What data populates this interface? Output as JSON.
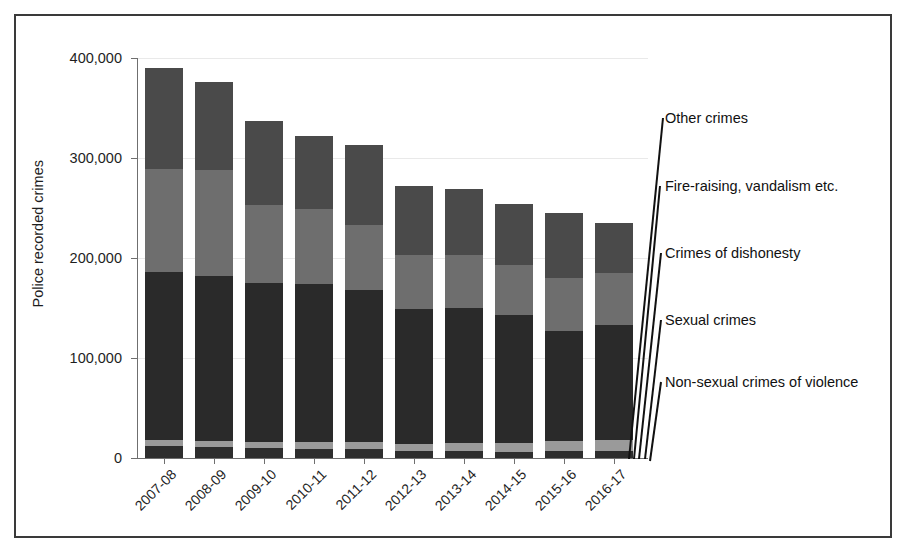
{
  "chart_data": {
    "type": "bar",
    "subtype": "stacked-bar",
    "title": "",
    "xlabel": "",
    "ylabel": "Police recorded crimes",
    "ylim": [
      0,
      400000
    ],
    "yticks": [
      0,
      100000,
      200000,
      300000,
      400000
    ],
    "ytick_labels": [
      "0",
      "100,000",
      "200,000",
      "300,000",
      "400,000"
    ],
    "grid": true,
    "legend_position": "right-callouts",
    "categories": [
      "2007-08",
      "2008-09",
      "2009-10",
      "2010-11",
      "2011-12",
      "2012-13",
      "2013-14",
      "2014-15",
      "2015-16",
      "2016-17"
    ],
    "series": [
      {
        "name": "Non-sexual crimes of violence",
        "color": "#2d2d2d",
        "values": [
          12000,
          11500,
          10000,
          9500,
          9000,
          7000,
          6800,
          6500,
          7200,
          7200
        ]
      },
      {
        "name": "Sexual crimes",
        "color": "#9a9a9a",
        "values": [
          6000,
          6000,
          6000,
          6500,
          7500,
          7500,
          8000,
          9000,
          10000,
          10800
        ]
      },
      {
        "name": "Crimes of dishonesty",
        "color": "#2a2a2a",
        "values": [
          168000,
          165000,
          159000,
          158000,
          152000,
          135000,
          135000,
          128000,
          110000,
          115000
        ]
      },
      {
        "name": "Fire-raising, vandalism etc.",
        "color": "#6e6e6e",
        "values": [
          103000,
          106000,
          78000,
          75000,
          65000,
          54000,
          53000,
          50000,
          53000,
          52000
        ]
      },
      {
        "name": "Other crimes",
        "color": "#4a4a4a",
        "values": [
          101000,
          88000,
          84000,
          73000,
          80000,
          69000,
          66000,
          61000,
          65000,
          50000
        ]
      }
    ],
    "totals": [
      390000,
      376500,
      337000,
      322000,
      313500,
      272500,
      268800,
      254500,
      245200,
      235000
    ],
    "annotations": [
      {
        "text": "Other crimes"
      },
      {
        "text": "Fire-raising, vandalism etc."
      },
      {
        "text": "Crimes of dishonesty"
      },
      {
        "text": "Sexual crimes"
      },
      {
        "text": "Non-sexual crimes of violence"
      }
    ]
  }
}
